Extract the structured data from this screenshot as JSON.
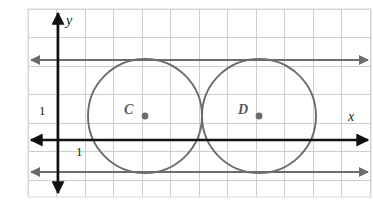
{
  "figure": {
    "kind": "coordinate-grid-diagram",
    "background": "#ffffff",
    "colors": {
      "grid": "#c9c9cd",
      "axis": "#111111",
      "tangent_line": "#6b6b70",
      "circle": "#6b6b70",
      "center_dot": "#6b6b70",
      "label_text": "#231f20",
      "circle_label_text": "#595959",
      "frame": "#d8d8dc"
    },
    "grid": {
      "spacing_px": 28.5,
      "left_px": 28,
      "right_px": 371,
      "top_px": 9,
      "bottom_px": 197,
      "visible": true
    },
    "axes": {
      "x": {
        "label": "x",
        "y_px": 140,
        "arrow_both_ends": true
      },
      "y": {
        "label": "y",
        "x_px": 58,
        "arrow_both_ends": true
      }
    },
    "tick_labels": [
      {
        "name": "y-unit-label",
        "text": "1",
        "x_px": 39,
        "y_px": 104
      },
      {
        "name": "x-unit-label",
        "text": "1",
        "x_px": 76,
        "y_px": 145
      }
    ],
    "tangent_lines": [
      {
        "name": "upper-tangent-line",
        "y_px": 60,
        "arrow_both_ends": true
      },
      {
        "name": "lower-tangent-line",
        "y_px": 172,
        "arrow_both_ends": true
      }
    ],
    "circles": [
      {
        "label": "C",
        "cx_px": 145,
        "cy_px": 116,
        "r_px": 57,
        "label_x_px": 124,
        "label_y_px": 103
      },
      {
        "label": "D",
        "cx_px": 259,
        "cy_px": 116,
        "r_px": 57,
        "label_x_px": 238,
        "label_y_px": 103
      }
    ]
  },
  "chart_data": {
    "type": "scatter",
    "title": "",
    "xlabel": "x",
    "ylabel": "y",
    "grid": true,
    "legend": null,
    "unit_labels": [
      "1",
      "1"
    ],
    "annotations": [
      "C",
      "D"
    ],
    "series": [
      {
        "name": "Circle C center",
        "x": [
          3
        ],
        "y": [
          0.85
        ]
      },
      {
        "name": "Circle D center",
        "x": [
          7
        ],
        "y": [
          0.85
        ]
      }
    ],
    "shapes": [
      {
        "type": "circle",
        "label": "C",
        "center": [
          3,
          0.85
        ],
        "radius": 2
      },
      {
        "type": "circle",
        "label": "D",
        "center": [
          7,
          0.85
        ],
        "radius": 2
      },
      {
        "type": "hline",
        "label": "upper tangent",
        "y": 2.85
      },
      {
        "type": "hline",
        "label": "lower tangent",
        "y": -1.15
      }
    ]
  }
}
